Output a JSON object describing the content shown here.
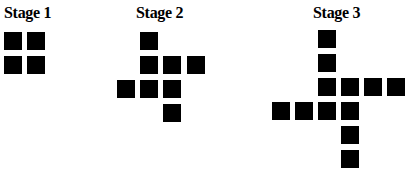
{
  "figure": {
    "square_color": "#000000",
    "background_color": "#ffffff",
    "stages": [
      {
        "label": "Stage 1",
        "label_pos": [
          4,
          5
        ],
        "square_count": 4,
        "squares": [
          [
            4,
            32
          ],
          [
            27,
            32
          ],
          [
            4,
            56
          ],
          [
            27,
            56
          ]
        ]
      },
      {
        "label": "Stage 2",
        "label_pos": [
          136,
          5
        ],
        "square_count": 8,
        "squares": [
          [
            140,
            32
          ],
          [
            140,
            56
          ],
          [
            163,
            56
          ],
          [
            187,
            56
          ],
          [
            117,
            80
          ],
          [
            140,
            80
          ],
          [
            163,
            80
          ],
          [
            163,
            104
          ]
        ]
      },
      {
        "label": "Stage 3",
        "label_pos": [
          313,
          5
        ],
        "square_count": 12,
        "squares": [
          [
            318,
            30
          ],
          [
            318,
            54
          ],
          [
            318,
            78
          ],
          [
            341,
            78
          ],
          [
            364,
            78
          ],
          [
            387,
            78
          ],
          [
            272,
            102
          ],
          [
            295,
            102
          ],
          [
            318,
            102
          ],
          [
            341,
            102
          ],
          [
            341,
            126
          ],
          [
            341,
            150
          ]
        ]
      }
    ]
  }
}
